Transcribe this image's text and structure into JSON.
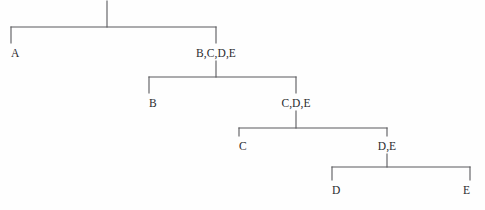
{
  "diagram": {
    "type": "hierarchical-partition-tree",
    "title": "",
    "background_color": "#fefefe",
    "line_color": "#58585c",
    "text_color": "#2b2b2e",
    "width": 485,
    "height": 210,
    "nodes": [
      {
        "id": "root",
        "label": "",
        "x": 107,
        "y": 0,
        "align": "center"
      },
      {
        "id": "a",
        "label": "A",
        "x": 11,
        "y": 47,
        "align": "left"
      },
      {
        "id": "bcde",
        "label": "B,C,D,E",
        "x": 216,
        "y": 47,
        "align": "center"
      },
      {
        "id": "b",
        "label": "B",
        "x": 149,
        "y": 97,
        "align": "left"
      },
      {
        "id": "cde",
        "label": "C,D,E",
        "x": 296,
        "y": 97,
        "align": "center"
      },
      {
        "id": "c",
        "label": "C",
        "x": 239,
        "y": 140,
        "align": "left"
      },
      {
        "id": "de",
        "label": "D,E",
        "x": 387,
        "y": 140,
        "align": "center"
      },
      {
        "id": "d",
        "label": "D",
        "x": 332,
        "y": 184,
        "align": "left"
      },
      {
        "id": "e",
        "label": "E",
        "x": 470,
        "y": 184,
        "align": "right"
      }
    ],
    "edges": [
      {
        "id": "stem-root",
        "from": "root",
        "to": "bar-1",
        "x1": 107,
        "y1": 1,
        "x2": 107,
        "y2": 27
      },
      {
        "id": "bar-1",
        "from": "root",
        "to": "split-1",
        "x1": 11,
        "y1": 27,
        "x2": 216,
        "y2": 27
      },
      {
        "id": "drop-a",
        "from": "bar-1",
        "to": "a",
        "x1": 11,
        "y1": 27,
        "x2": 11,
        "y2": 43
      },
      {
        "id": "drop-bcde",
        "from": "bar-1",
        "to": "bcde",
        "x1": 216,
        "y1": 27,
        "x2": 216,
        "y2": 43
      },
      {
        "id": "stem-bcde",
        "from": "bcde",
        "to": "bar-2",
        "x1": 216,
        "y1": 61,
        "x2": 216,
        "y2": 77
      },
      {
        "id": "bar-2",
        "from": "bcde",
        "to": "split-2",
        "x1": 149,
        "y1": 77,
        "x2": 296,
        "y2": 77
      },
      {
        "id": "drop-b",
        "from": "bar-2",
        "to": "b",
        "x1": 149,
        "y1": 77,
        "x2": 149,
        "y2": 93
      },
      {
        "id": "drop-cde",
        "from": "bar-2",
        "to": "cde",
        "x1": 296,
        "y1": 77,
        "x2": 296,
        "y2": 93
      },
      {
        "id": "stem-cde",
        "from": "cde",
        "to": "bar-3",
        "x1": 296,
        "y1": 111,
        "x2": 296,
        "y2": 128
      },
      {
        "id": "bar-3",
        "from": "cde",
        "to": "split-3",
        "x1": 239,
        "y1": 128,
        "x2": 387,
        "y2": 128
      },
      {
        "id": "drop-c",
        "from": "bar-3",
        "to": "c",
        "x1": 239,
        "y1": 128,
        "x2": 239,
        "y2": 136
      },
      {
        "id": "drop-de",
        "from": "bar-3",
        "to": "de",
        "x1": 387,
        "y1": 128,
        "x2": 387,
        "y2": 136
      },
      {
        "id": "stem-de",
        "from": "de",
        "to": "bar-4",
        "x1": 387,
        "y1": 154,
        "x2": 387,
        "y2": 167
      },
      {
        "id": "bar-4",
        "from": "de",
        "to": "split-4",
        "x1": 332,
        "y1": 167,
        "x2": 470,
        "y2": 167
      },
      {
        "id": "drop-d",
        "from": "bar-4",
        "to": "d",
        "x1": 332,
        "y1": 167,
        "x2": 332,
        "y2": 180
      },
      {
        "id": "drop-e",
        "from": "bar-4",
        "to": "e",
        "x1": 470,
        "y1": 167,
        "x2": 470,
        "y2": 180
      }
    ]
  }
}
